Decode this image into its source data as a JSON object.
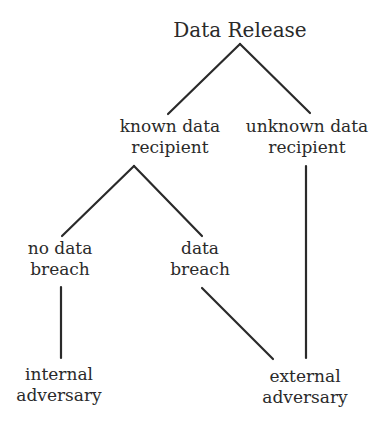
{
  "diagram": {
    "type": "tree",
    "line_color": "#2a2a2a",
    "nodes": {
      "root": {
        "line1": "Data Release"
      },
      "known": {
        "line1": "known data",
        "line2": "recipient"
      },
      "unknown": {
        "line1": "unknown data",
        "line2": "recipient"
      },
      "no_breach": {
        "line1": "no data",
        "line2": "breach"
      },
      "breach": {
        "line1": "data",
        "line2": "breach"
      },
      "internal": {
        "line1": "internal",
        "line2": "adversary"
      },
      "external": {
        "line1": "external",
        "line2": "adversary"
      }
    },
    "edges": [
      [
        "Data Release",
        "known data recipient"
      ],
      [
        "Data Release",
        "unknown data recipient"
      ],
      [
        "known data recipient",
        "no data breach"
      ],
      [
        "known data recipient",
        "data breach"
      ],
      [
        "no data breach",
        "internal adversary"
      ],
      [
        "data breach",
        "external adversary"
      ],
      [
        "unknown data recipient",
        "external adversary"
      ]
    ]
  }
}
